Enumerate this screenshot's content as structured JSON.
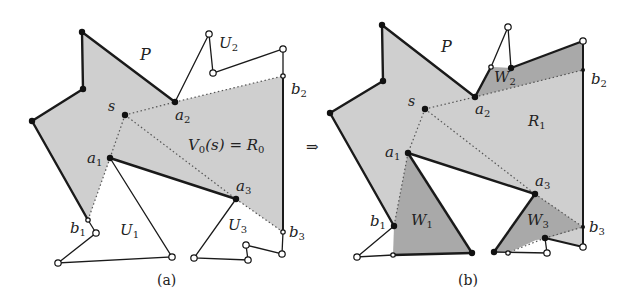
{
  "figure": {
    "arrow_symbol": "⇒",
    "colors": {
      "region_light": "#cfcfcf",
      "region_dark": "#a9a9a9",
      "edge": "#1a1a1a",
      "background": "#ffffff"
    }
  },
  "panel_a": {
    "caption": "(a)",
    "labels": {
      "P": "P",
      "s": "s",
      "a1": "a",
      "a1_sub": "1",
      "a2": "a",
      "a2_sub": "2",
      "a3": "a",
      "a3_sub": "3",
      "b1": "b",
      "b1_sub": "1",
      "b2": "b",
      "b2_sub": "2",
      "b3": "b",
      "b3_sub": "3",
      "U1": "U",
      "U1_sub": "1",
      "U2": "U",
      "U2_sub": "2",
      "U3": "U",
      "U3_sub": "3",
      "region": "V",
      "region_rest": "(s) = R",
      "region_sub0": "0",
      "region_sub1": "0"
    }
  },
  "panel_b": {
    "caption": "(b)",
    "labels": {
      "P": "P",
      "s": "s",
      "a1": "a",
      "a1_sub": "1",
      "a2": "a",
      "a2_sub": "2",
      "a3": "a",
      "a3_sub": "3",
      "b1": "b",
      "b1_sub": "1",
      "b2": "b",
      "b2_sub": "2",
      "b3": "b",
      "b3_sub": "3",
      "R1": "R",
      "R1_sub": "1",
      "W1": "W",
      "W1_sub": "1",
      "W2": "W",
      "W2_sub": "2",
      "W3": "W",
      "W3_sub": "3"
    }
  }
}
